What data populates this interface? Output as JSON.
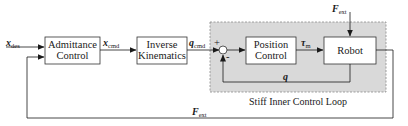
{
  "diagram": {
    "blocks": [
      {
        "id": "admittance",
        "line1": "Admittance",
        "line2": "Control"
      },
      {
        "id": "inverse_kinematics",
        "line1": "Inverse",
        "line2": "Kinematics"
      },
      {
        "id": "position_control",
        "line1": "Position",
        "line2": "Control"
      },
      {
        "id": "robot",
        "line1": "Robot"
      }
    ],
    "summing_junction": {
      "plus": "+",
      "minus": "-"
    },
    "signals": {
      "x_des": {
        "main": "x",
        "sub": "des"
      },
      "x_cmd": {
        "main": "x",
        "sub": "cmd"
      },
      "q_cmd": {
        "main": "q",
        "sub": "cmd"
      },
      "tau_m": {
        "main": "τ",
        "sub": "m"
      },
      "q": {
        "main": "q"
      },
      "f_ext_top": {
        "main": "F",
        "sub": "ext"
      },
      "f_ext_feedback": {
        "main": "F",
        "sub": "ext"
      }
    },
    "region": {
      "label": "Stiff Inner Control Loop",
      "fill": "#d9d9d9",
      "border": "#8a8a8a"
    }
  }
}
